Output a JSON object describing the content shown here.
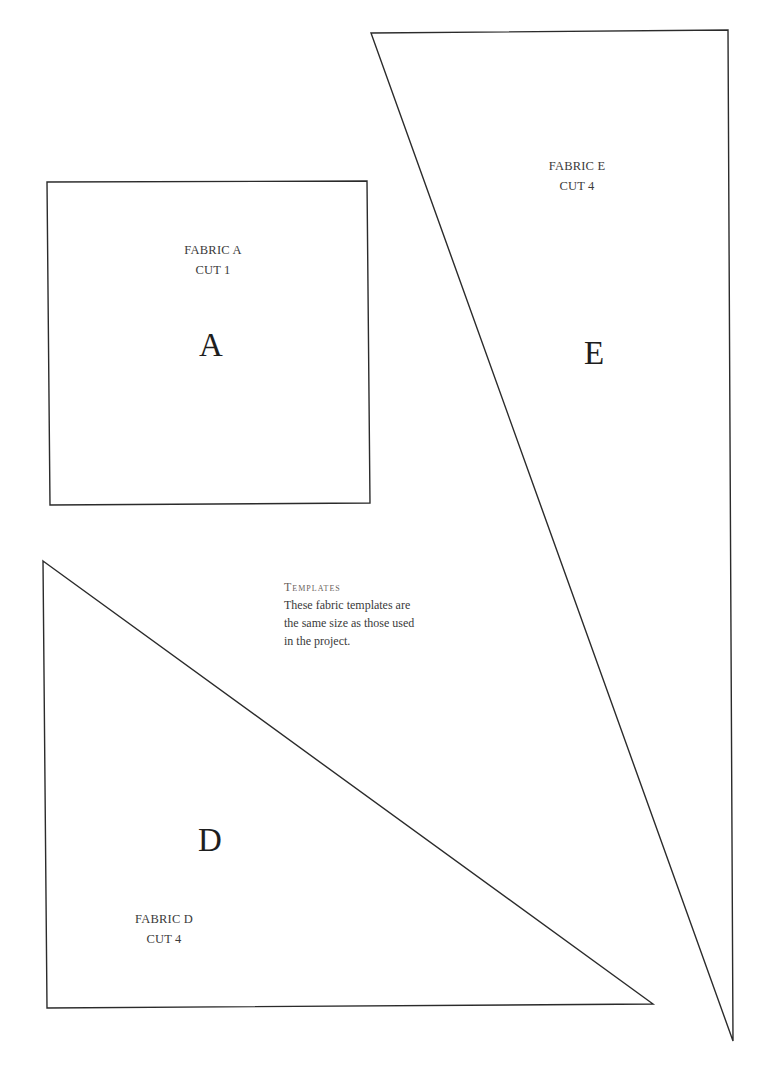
{
  "pieces": [
    {
      "id": "A",
      "shape": "square",
      "letter": "A",
      "fabric_label": "FABRIC A",
      "cut_label": "CUT 1",
      "points": "47,182 367,181 370,503 50,505"
    },
    {
      "id": "E",
      "shape": "triangle",
      "letter": "E",
      "fabric_label": "FABRIC E",
      "cut_label": "CUT 4",
      "points": "371,33 728,30 733,1041"
    },
    {
      "id": "D",
      "shape": "triangle",
      "letter": "D",
      "fabric_label": "FABRIC D",
      "cut_label": "CUT 4",
      "points": "43,561 653,1004 47,1008"
    }
  ],
  "note": {
    "heading": "Templates",
    "lines": [
      "These fabric templates are",
      "the same size as those used",
      "in the project."
    ]
  },
  "colors": {
    "outline": "#2b2b2b",
    "text": "#3a3a3a",
    "heading": "#6a625c",
    "background": "#ffffff"
  }
}
